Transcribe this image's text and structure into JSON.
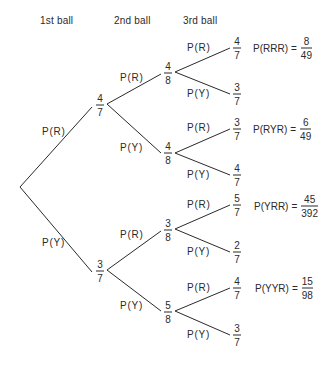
{
  "headers": [
    "1st ball",
    "2nd ball",
    "3rd ball"
  ],
  "tree": {
    "level1": [
      {
        "label": "P(R)",
        "num": "4",
        "den": "7"
      },
      {
        "label": "P(Y)",
        "num": "3",
        "den": "7"
      }
    ],
    "level2": [
      {
        "label": "P(R)",
        "num": "4",
        "den": "8"
      },
      {
        "label": "P(Y)",
        "num": "4",
        "den": "8"
      },
      {
        "label": "P(R)",
        "num": "3",
        "den": "8"
      },
      {
        "label": "P(Y)",
        "num": "5",
        "den": "8"
      }
    ],
    "level3": [
      {
        "label": "P(R)",
        "num": "4",
        "den": "7"
      },
      {
        "label": "P(Y)",
        "num": "3",
        "den": "7"
      },
      {
        "label": "P(R)",
        "num": "3",
        "den": "7"
      },
      {
        "label": "P(Y)",
        "num": "4",
        "den": "7"
      },
      {
        "label": "P(R)",
        "num": "5",
        "den": "7"
      },
      {
        "label": "P(Y)",
        "num": "2",
        "den": "7"
      },
      {
        "label": "P(R)",
        "num": "4",
        "den": "7"
      },
      {
        "label": "P(Y)",
        "num": "3",
        "den": "7"
      }
    ]
  },
  "results": [
    {
      "expr": "P(RRR)",
      "eq": "=",
      "num": "8",
      "den": "49"
    },
    {
      "expr": "P(RYR)",
      "eq": "=",
      "num": "6",
      "den": "49"
    },
    {
      "expr": "P(YRR)",
      "eq": "=",
      "num": "45",
      "den": "392"
    },
    {
      "expr": "P(YYR)",
      "eq": "=",
      "num": "15",
      "den": "98"
    }
  ],
  "colors": {
    "ink": "#2a2a2a",
    "background": "#ffffff"
  }
}
